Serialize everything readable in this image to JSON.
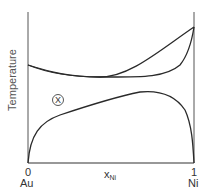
{
  "diagram": {
    "type": "phase-diagram",
    "y_axis_label": "Temperature",
    "x_axis_label": "x",
    "x_axis_subscript": "Ni",
    "x_ticks": [
      {
        "value": "0",
        "element": "Au"
      },
      {
        "value": "1",
        "element": "Ni"
      }
    ],
    "annotation": "X",
    "curves": [
      "liquidus",
      "solidus",
      "miscibility-gap"
    ]
  }
}
